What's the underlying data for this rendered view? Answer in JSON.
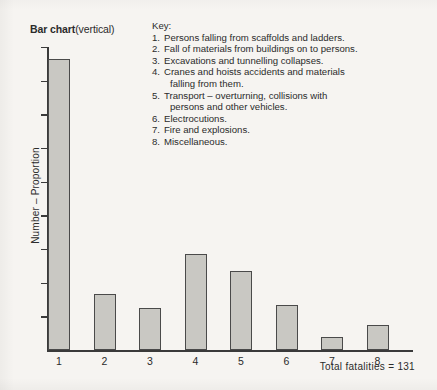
{
  "chart_data": {
    "type": "bar",
    "title": "Bar chart",
    "title_suffix": "(vertical)",
    "xlabel": "",
    "ylabel": "Number – Proportion",
    "categories": [
      "1",
      "2",
      "3",
      "4",
      "5",
      "6",
      "7",
      "8"
    ],
    "values": [
      44,
      8,
      6,
      14,
      12,
      7,
      2,
      4
    ],
    "bar_pixel_heights": [
      291,
      56,
      42,
      96,
      79,
      45,
      13,
      25
    ],
    "ylim": [
      0,
      48
    ],
    "grid": false,
    "legend_position": "top-right",
    "y_tick_count": 9,
    "bar_color": "#c9c8c3",
    "bar_edge_color": "#4a4a4a",
    "axis_color": "#3a3a3a",
    "annotation": "Total fatalities  =  131",
    "total_fatalities": 131,
    "legend": {
      "heading": "Key:",
      "entries": [
        {
          "num": "1.",
          "text": "Persons falling from scaffolds and ladders.",
          "cont": ""
        },
        {
          "num": "2.",
          "text": "Fall of materials from buildings on to persons.",
          "cont": ""
        },
        {
          "num": "3.",
          "text": "Excavations and tunnelling collapses.",
          "cont": ""
        },
        {
          "num": "4.",
          "text": "Cranes and hoists accidents and materials",
          "cont": "falling from them."
        },
        {
          "num": "5.",
          "text": "Transport – overturning, collisions with",
          "cont": "persons and other vehicles."
        },
        {
          "num": "6.",
          "text": "Electrocutions.",
          "cont": ""
        },
        {
          "num": "7.",
          "text": "Fire and explosions.",
          "cont": ""
        },
        {
          "num": "8.",
          "text": "Miscellaneous.",
          "cont": ""
        }
      ]
    }
  }
}
